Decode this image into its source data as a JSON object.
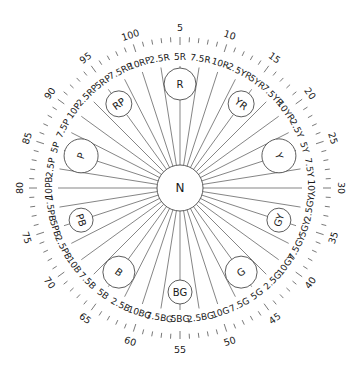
{
  "diagram": {
    "center": {
      "label": "N",
      "x": 180,
      "y": 188,
      "r": 23
    },
    "geometry": {
      "start_number": 5,
      "degrees_per_unit": 3.6,
      "tick_inner_r": 146,
      "tick_outer_r": 151,
      "major_tick_inner_r": 143,
      "number_label_r": 161,
      "spoke_outer_r": 122,
      "hue_label_r": 131,
      "hue_circle_r_dist": 104
    },
    "numbers": [
      5,
      10,
      15,
      20,
      25,
      30,
      35,
      40,
      45,
      50,
      55,
      60,
      65,
      70,
      75,
      80,
      85,
      90,
      95,
      100
    ],
    "hues": [
      {
        "name": "R",
        "number": 5,
        "circle_r": 16,
        "labels": [
          "2.5R",
          "5R",
          "7.5R",
          "10R"
        ]
      },
      {
        "name": "YR",
        "number": 15,
        "circle_r": 13,
        "labels": [
          "2.5YR",
          "5YR",
          "7.5YR",
          "10YR"
        ]
      },
      {
        "name": "Y",
        "number": 25,
        "circle_r": 17,
        "labels": [
          "2.5Y",
          "5Y",
          "7.5Y",
          "10Y"
        ]
      },
      {
        "name": "GY",
        "number": 35,
        "circle_r": 12,
        "labels": [
          "2.5GY",
          "5GY",
          "7.5GY",
          "10GY"
        ]
      },
      {
        "name": "G",
        "number": 45,
        "circle_r": 16,
        "labels": [
          "2.5G",
          "5G",
          "7.5G",
          "10G"
        ]
      },
      {
        "name": "BG",
        "number": 55,
        "circle_r": 12,
        "labels": [
          "2.5BG",
          "5BG",
          "7.5BG",
          "10BG"
        ]
      },
      {
        "name": "B",
        "number": 65,
        "circle_r": 16,
        "labels": [
          "2.5B",
          "5B",
          "7.5B",
          "10B"
        ]
      },
      {
        "name": "PB",
        "number": 75,
        "circle_r": 12,
        "labels": [
          "2.5PB",
          "5PB",
          "7.5PB",
          "10PB"
        ]
      },
      {
        "name": "P",
        "number": 85,
        "circle_r": 17,
        "labels": [
          "2.5P",
          "5P",
          "7.5P",
          "10P"
        ]
      },
      {
        "name": "RP",
        "number": 95,
        "circle_r": 13,
        "labels": [
          "2.5RP",
          "5RP",
          "7.5RP",
          "10RP"
        ]
      }
    ],
    "colors": {
      "line": "#333333",
      "text": "#1a1a1a",
      "background": "#ffffff"
    }
  }
}
